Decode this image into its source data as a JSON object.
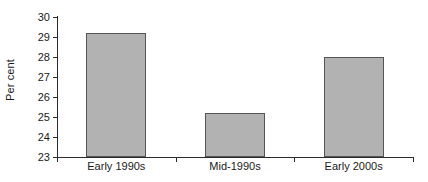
{
  "chart_data": {
    "type": "bar",
    "title": "",
    "subtitle": "",
    "xlabel": "",
    "ylabel": "Per cent",
    "categories": [
      "Early 1990s",
      "Mid-1990s",
      "Early 2000s"
    ],
    "values": [
      29.2,
      25.2,
      28.0
    ],
    "ylim": [
      23,
      30
    ],
    "yticks": [
      23,
      24,
      25,
      26,
      27,
      28,
      29,
      30
    ],
    "ytick_labels": [
      "23",
      "24",
      "25",
      "26",
      "27",
      "28",
      "29",
      "30"
    ],
    "grid": false,
    "legend": false,
    "legend_position": "none",
    "bar_fill_color": "#b2b2b2",
    "bar_edge_color": "#555555",
    "axis_color": "#2b2b2b",
    "background_color": "#ffffff"
  }
}
